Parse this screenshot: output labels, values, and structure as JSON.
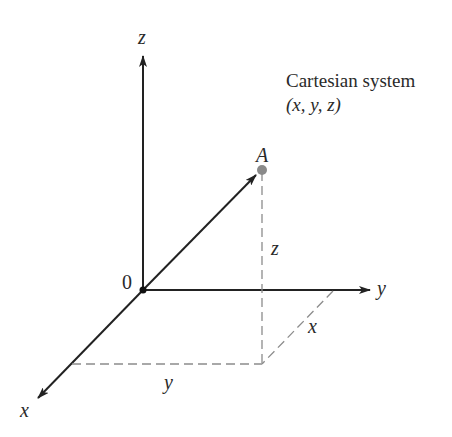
{
  "title": {
    "line1": "Cartesian system",
    "line2": "(x, y, z)"
  },
  "axes": {
    "z_label": "z",
    "y_label": "y",
    "x_label": "x",
    "origin_label": "0"
  },
  "point": {
    "label": "A",
    "color": "#8a8a8a"
  },
  "projections": {
    "z_label": "z",
    "x_label": "x",
    "y_label": "y"
  },
  "colors": {
    "axis": "#222222",
    "dashed": "#8c8c8c",
    "text": "#2a2a2a"
  }
}
